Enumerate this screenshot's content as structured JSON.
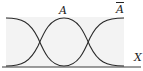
{
  "diagram": {
    "type": "fuzzy-membership",
    "labels": {
      "set_a": "A",
      "complement": "A",
      "axis": "X"
    },
    "colors": {
      "curve": "#2a2a2a",
      "axis": "#3a3a3a",
      "fill": "#f3f3f3",
      "background": "#ffffff"
    }
  }
}
